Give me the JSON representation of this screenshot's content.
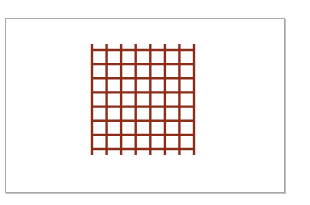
{
  "figure": {
    "name": "red-grid-lattice",
    "canvas": {
      "width": 310,
      "height": 205,
      "background_color": "#ffffff"
    },
    "frame": {
      "x": 5,
      "y": 18,
      "width": 280,
      "height": 175,
      "fill_color": "#ffffff",
      "border_color": "#a8a8a8",
      "border_width": 1,
      "shadow_color": "#8c8c8c"
    }
  },
  "chart_data": {
    "type": "line",
    "title": "",
    "subtitle": "",
    "xlabel": "",
    "ylabel": "",
    "grid": true,
    "legend": "none",
    "line_color": "#8c2d19",
    "line_width": 2.4,
    "vertical_line_count": 8,
    "horizontal_line_count": 8,
    "cell_columns": 7,
    "cell_rows": 7,
    "vertical_overshoot": 6,
    "grid_bounds": {
      "x0": 91,
      "y0": 49,
      "x1": 193,
      "y1": 148
    },
    "x": [
      91,
      105.6,
      120.1,
      134.7,
      149.3,
      163.9,
      178.4,
      193
    ],
    "y": [
      49,
      63.1,
      77.3,
      91.4,
      105.6,
      119.7,
      133.9,
      148
    ],
    "xlim": [
      91,
      193
    ],
    "ylim": [
      49,
      148
    ],
    "series": [
      {
        "name": "vertical-lines",
        "orientation": "vertical",
        "values": [
          91,
          105.6,
          120.1,
          134.7,
          149.3,
          163.9,
          178.4,
          193
        ]
      },
      {
        "name": "horizontal-lines",
        "orientation": "horizontal",
        "values": [
          49,
          63.1,
          77.3,
          91.4,
          105.6,
          119.7,
          133.9,
          148
        ]
      }
    ]
  }
}
